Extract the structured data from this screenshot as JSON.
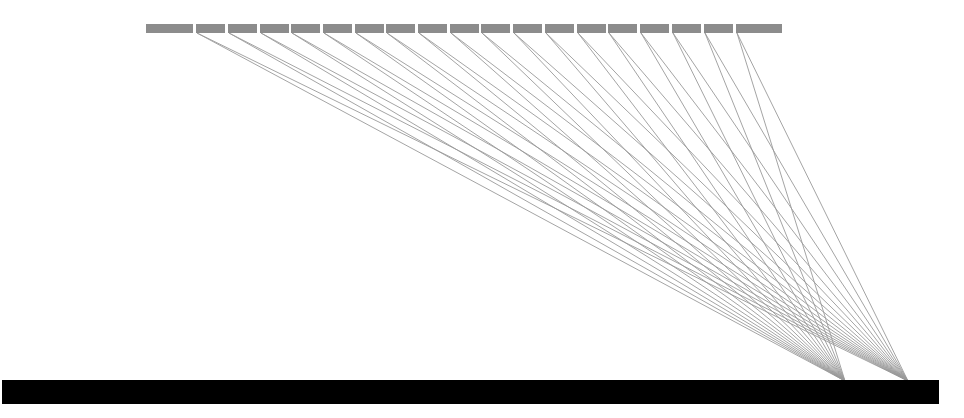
{
  "diagram": {
    "type": "tree-edges-to-base",
    "colors": {
      "background": "#ffffff",
      "top_node": "#8c8c8c",
      "edge": "#9a9a9a",
      "base_bar": "#000000"
    },
    "top_row": {
      "y": 24,
      "height": 9,
      "nodes": [
        {
          "x": 146,
          "w": 47,
          "edges": false
        },
        {
          "x": 196,
          "w": 29,
          "edges": true
        },
        {
          "x": 228,
          "w": 29,
          "edges": true
        },
        {
          "x": 260,
          "w": 29,
          "edges": true
        },
        {
          "x": 291,
          "w": 29,
          "edges": true
        },
        {
          "x": 323,
          "w": 29,
          "edges": true
        },
        {
          "x": 355,
          "w": 29,
          "edges": true
        },
        {
          "x": 386,
          "w": 29,
          "edges": true
        },
        {
          "x": 418,
          "w": 29,
          "edges": true
        },
        {
          "x": 450,
          "w": 29,
          "edges": true
        },
        {
          "x": 481,
          "w": 29,
          "edges": true
        },
        {
          "x": 513,
          "w": 29,
          "edges": true
        },
        {
          "x": 545,
          "w": 29,
          "edges": true
        },
        {
          "x": 577,
          "w": 29,
          "edges": true
        },
        {
          "x": 608,
          "w": 29,
          "edges": true
        },
        {
          "x": 640,
          "w": 29,
          "edges": true
        },
        {
          "x": 672,
          "w": 29,
          "edges": true
        },
        {
          "x": 704,
          "w": 29,
          "edges": true
        },
        {
          "x": 736,
          "w": 46,
          "edges": true
        }
      ]
    },
    "convergence_points": [
      {
        "x": 845,
        "y": 381
      },
      {
        "x": 908,
        "y": 381
      }
    ],
    "base_bar": {
      "x": 2,
      "y": 380,
      "w": 937,
      "h": 24
    }
  }
}
